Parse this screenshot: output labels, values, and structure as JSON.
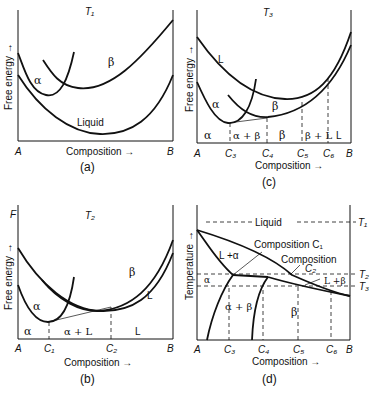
{
  "panels": {
    "a": {
      "caption": "(a)",
      "temperature": "T₁",
      "ylabel": "Free energy →",
      "xlabel": "Composition →",
      "x_left": "A",
      "x_right": "B",
      "curves": [
        "α",
        "β",
        "Liquid"
      ]
    },
    "b": {
      "caption": "(b)",
      "temperature": "T₂",
      "yaxis_top": "F",
      "ylabel": "Free energy →",
      "xlabel": "Composition →",
      "x_left": "A",
      "x_right": "B",
      "ticks": [
        "C₁",
        "C₂"
      ],
      "curves": [
        "α",
        "β",
        "L"
      ],
      "regions": [
        "α",
        "α + L",
        "L"
      ]
    },
    "c": {
      "caption": "(c)",
      "temperature": "T₃",
      "ylabel": "Free energy →",
      "xlabel": "Composition →",
      "x_left": "A",
      "x_right": "B",
      "ticks": [
        "C₃",
        "C₄",
        "C₅",
        "C₆"
      ],
      "curves": [
        "L",
        "α",
        "β"
      ],
      "regions": [
        "α",
        "α + β",
        "β",
        "β + L",
        "L"
      ]
    },
    "d": {
      "caption": "(d)",
      "ylabel": "Temperature →",
      "xlabel": "Composition →",
      "x_left": "A",
      "x_right": "B",
      "ticks": [
        "C₃",
        "C₄",
        "C₅",
        "C₆"
      ],
      "temps": [
        "T₁",
        "T₂",
        "T₃"
      ],
      "regions": [
        "Liquid",
        "L +α",
        "α",
        "α + β",
        "β",
        "L +β"
      ],
      "annotations": [
        "Composition C₁",
        "Composition",
        "C₂"
      ]
    }
  }
}
